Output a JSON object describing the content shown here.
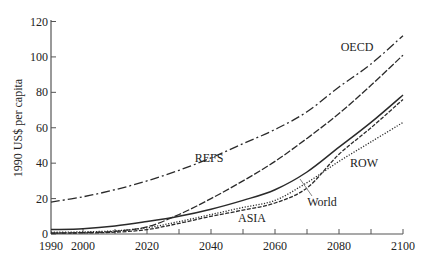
{
  "chart_data": {
    "type": "line",
    "title": "",
    "xlabel": "",
    "ylabel": "1990 US$ per capita",
    "xlim": [
      1990,
      2100
    ],
    "ylim": [
      0,
      120
    ],
    "x_ticks": [
      1990,
      2000,
      2020,
      2040,
      2060,
      2080,
      2100
    ],
    "x_minor_ticks": [
      2000,
      2010,
      2020,
      2030,
      2040,
      2050,
      2060,
      2070,
      2080,
      2090,
      2100
    ],
    "y_ticks": [
      0,
      20,
      40,
      60,
      80,
      100,
      120
    ],
    "grid": false,
    "legend": "inline labels",
    "x": [
      1990,
      2000,
      2010,
      2020,
      2030,
      2040,
      2050,
      2060,
      2070,
      2080,
      2090,
      2100
    ],
    "series": [
      {
        "name": "OECD",
        "style": "dashdot",
        "values": [
          18,
          21,
          25,
          30,
          36,
          43,
          51,
          59,
          69,
          83,
          96,
          112
        ]
      },
      {
        "name": "REFS",
        "style": "dashed",
        "values": [
          0.5,
          0.8,
          1.5,
          4,
          11,
          20,
          30,
          41,
          54,
          68,
          84,
          101
        ]
      },
      {
        "name": "World",
        "style": "solid",
        "values": [
          2.5,
          3,
          4.5,
          7,
          10,
          14,
          19,
          25,
          35,
          49,
          63,
          78.5
        ]
      },
      {
        "name": "ASIA",
        "style": "dashed-fine",
        "values": [
          0.5,
          0.6,
          1,
          2.5,
          6,
          10,
          13.5,
          17.5,
          26,
          45,
          60,
          76
        ]
      },
      {
        "name": "ROW",
        "style": "dotted",
        "values": [
          1,
          1.2,
          1.8,
          3.5,
          7,
          11,
          15,
          19,
          29,
          41,
          52,
          63
        ]
      }
    ],
    "annotations": [
      {
        "text": "OECD",
        "x": 2088,
        "y": 105
      },
      {
        "text": "REFS",
        "x": 2046,
        "y": 42
      },
      {
        "text": "World",
        "x": 2071,
        "y": 17,
        "leader_to": [
          2067,
          30
        ]
      },
      {
        "text": "ASIA",
        "x": 2054,
        "y": 8
      },
      {
        "text": "ROW",
        "x": 2091,
        "y": 39
      }
    ]
  },
  "axes": {
    "ylabel": "1990 US$ per capita",
    "x_tick_labels": [
      "1990",
      "2000",
      "2020",
      "2040",
      "2060",
      "2080",
      "2100"
    ],
    "y_tick_labels": [
      "0",
      "20",
      "40",
      "60",
      "80",
      "100",
      "120"
    ]
  },
  "labels": {
    "oecd": "OECD",
    "refs": "REFS",
    "world": "World",
    "asia": "ASIA",
    "row": "ROW"
  }
}
